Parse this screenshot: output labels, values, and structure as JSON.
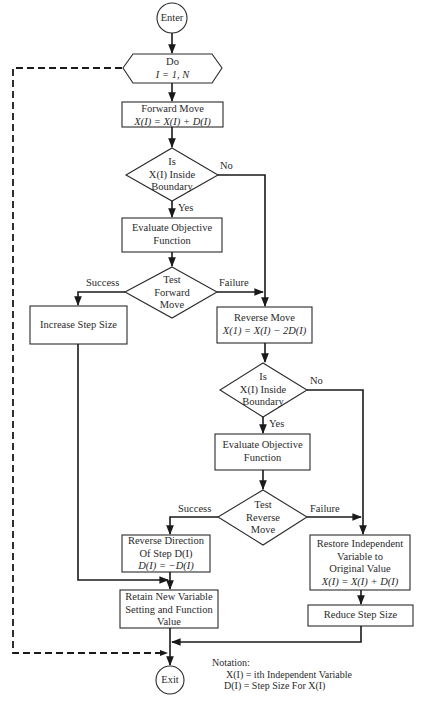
{
  "diagram": {
    "type": "flowchart",
    "colors": {
      "stroke": "#1a1a1a",
      "text": "#2a2a2a",
      "background": "#ffffff"
    },
    "nodes": {
      "enter": {
        "shape": "circle",
        "label": "Enter"
      },
      "do_loop": {
        "shape": "hexagon",
        "line1": "Do",
        "line2": "I = 1, N"
      },
      "forward_move": {
        "shape": "rect",
        "line1": "Forward Move",
        "line2": "X(I) = X(I) + D(I)"
      },
      "inside_boundary_1": {
        "shape": "diamond",
        "line1": "Is",
        "line2": "X(I) Inside",
        "line3": "Boundary"
      },
      "evaluate_1": {
        "shape": "rect",
        "line1": "Evaluate Objective",
        "line2": "Function"
      },
      "test_forward": {
        "shape": "diamond",
        "line1": "Test",
        "line2": "Forward",
        "line3": "Move"
      },
      "increase_step": {
        "shape": "rect",
        "label": "Increase Step Size"
      },
      "reverse_move": {
        "shape": "rect",
        "line1": "Reverse Move",
        "line2": "X(1) = X(I) − 2D(I)"
      },
      "inside_boundary_2": {
        "shape": "diamond",
        "line1": "Is",
        "line2": "X(I) Inside",
        "line3": "Boundary"
      },
      "evaluate_2": {
        "shape": "rect",
        "line1": "Evaluate Objective",
        "line2": "Function"
      },
      "test_reverse": {
        "shape": "diamond",
        "line1": "Test",
        "line2": "Reverse",
        "line3": "Move"
      },
      "reverse_direction": {
        "shape": "rect",
        "line1": "Reverse Direction",
        "line2": "Of Step D(I)",
        "line3": "D(I) = −D(I)"
      },
      "restore": {
        "shape": "rect",
        "line1": "Restore Independent",
        "line2": "Variable to",
        "line3": "Original Value",
        "line4": "X(I) = X(I) + D(I)"
      },
      "retain": {
        "shape": "rect",
        "line1": "Retain New Variable",
        "line2": "Setting and Function",
        "line3": "Value"
      },
      "reduce_step": {
        "shape": "rect",
        "label": "Reduce Step Size"
      },
      "exit": {
        "shape": "circle",
        "label": "Exit"
      }
    },
    "edge_labels": {
      "no_1": "No",
      "yes_1": "Yes",
      "success_1": "Success",
      "failure_1": "Failure",
      "no_2": "No",
      "yes_2": "Yes",
      "success_2": "Success",
      "failure_2": "Failure"
    },
    "edges": [
      {
        "from": "enter",
        "to": "do_loop"
      },
      {
        "from": "do_loop",
        "to": "forward_move"
      },
      {
        "from": "forward_move",
        "to": "inside_boundary_1"
      },
      {
        "from": "inside_boundary_1",
        "to": "evaluate_1",
        "label": "Yes"
      },
      {
        "from": "inside_boundary_1",
        "to": "reverse_move",
        "label": "No"
      },
      {
        "from": "evaluate_1",
        "to": "test_forward"
      },
      {
        "from": "test_forward",
        "to": "increase_step",
        "label": "Success"
      },
      {
        "from": "test_forward",
        "to": "reverse_move",
        "label": "Failure"
      },
      {
        "from": "reverse_move",
        "to": "inside_boundary_2"
      },
      {
        "from": "inside_boundary_2",
        "to": "evaluate_2",
        "label": "Yes"
      },
      {
        "from": "inside_boundary_2",
        "to": "restore",
        "label": "No"
      },
      {
        "from": "evaluate_2",
        "to": "test_reverse"
      },
      {
        "from": "test_reverse",
        "to": "reverse_direction",
        "label": "Success"
      },
      {
        "from": "test_reverse",
        "to": "restore",
        "label": "Failure"
      },
      {
        "from": "increase_step",
        "to": "retain"
      },
      {
        "from": "reverse_direction",
        "to": "retain"
      },
      {
        "from": "restore",
        "to": "reduce_step"
      },
      {
        "from": "retain",
        "to": "exit"
      },
      {
        "from": "reduce_step",
        "to": "exit"
      },
      {
        "from": "do_loop",
        "to": "exit",
        "style": "dashed"
      }
    ],
    "notation": {
      "title": "Notation:",
      "line1": "X(I) = ith Independent Variable",
      "line2": "D(I)  = Step Size For X(I)"
    }
  }
}
